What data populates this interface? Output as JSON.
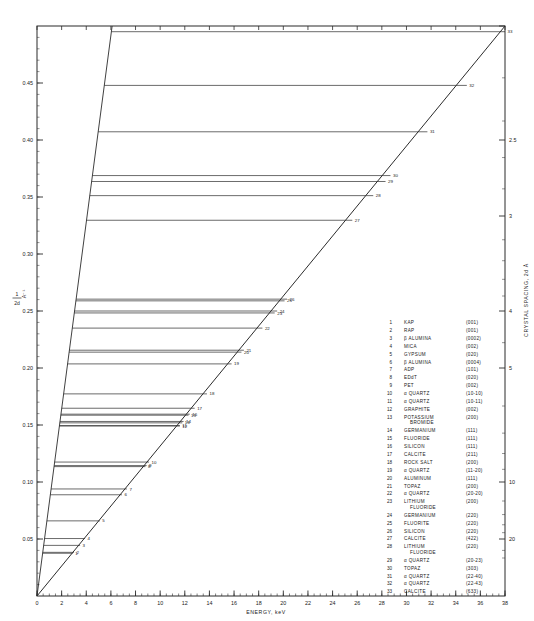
{
  "chart_data": {
    "type": "line",
    "title": "",
    "xlabel": "ENERGY, keV",
    "ylabel": "1/2d, A-1",
    "ylabel_numerator": "1",
    "ylabel_denominator": "2d",
    "ylabel_units": "A⁻¹",
    "right_axis_label": "CRYSTAL SPACING, 2d Å",
    "xlim": [
      0,
      38
    ],
    "ylim": [
      0,
      0.5
    ],
    "xticks": [
      0,
      2,
      4,
      6,
      8,
      10,
      12,
      14,
      16,
      18,
      20,
      22,
      24,
      26,
      28,
      30,
      32,
      34,
      36,
      38
    ],
    "xtick_labels": [
      "0",
      "2",
      "4",
      "6",
      "8",
      "10",
      "12",
      "14",
      "16",
      "18",
      "20",
      "22",
      "24",
      "26",
      "28",
      "30",
      "32",
      "34",
      "36",
      "38"
    ],
    "x_minor_step": 0.5,
    "yticks": [
      0.05,
      0.1,
      0.15,
      0.2,
      0.25,
      0.3,
      0.35,
      0.4,
      0.45
    ],
    "ytick_labels": [
      "0.05",
      "0.10",
      "0.15",
      "0.20",
      "0.25",
      "0.30",
      "0.35",
      "0.40",
      "0.45"
    ],
    "right_ticks_2d": [
      2,
      2.5,
      3,
      4,
      5,
      10,
      20
    ],
    "right_tick_labels": [
      "",
      "2.5",
      "3",
      "4",
      "5",
      "10",
      "20"
    ],
    "grid": false,
    "legend_position": "inside-right",
    "series": [
      {
        "name": "Bragg limit diagonal (1/2d = E/12.398)",
        "type": "line",
        "x": [
          0,
          38
        ],
        "y": [
          0,
          0.5
        ]
      },
      {
        "name": "Left boundary diagonal",
        "type": "line",
        "x": [
          0,
          6.1
        ],
        "y": [
          0,
          0.5
        ]
      }
    ],
    "points": [
      {
        "n": 1,
        "crystal": "KAP",
        "reflection": "(001)",
        "two_d": 26.632,
        "inv2d": 0.0375,
        "energy": 2.9
      },
      {
        "n": 2,
        "crystal": "RAP",
        "reflection": "(001)",
        "two_d": 26.121,
        "inv2d": 0.0383,
        "energy": 3.0
      },
      {
        "n": 3,
        "crystal": "β ALUMINA",
        "reflection": "(0002)",
        "two_d": 22.53,
        "inv2d": 0.0444,
        "energy": 3.5
      },
      {
        "n": 4,
        "crystal": "MICA",
        "reflection": "(002)",
        "two_d": 19.84,
        "inv2d": 0.0504,
        "energy": 3.9
      },
      {
        "n": 5,
        "crystal": "GYPSUM",
        "reflection": "(020)",
        "two_d": 15.185,
        "inv2d": 0.0659,
        "energy": 5.1
      },
      {
        "n": 6,
        "crystal": "β ALUMINA",
        "reflection": "(0004)",
        "two_d": 11.26,
        "inv2d": 0.0888,
        "energy": 6.9
      },
      {
        "n": 7,
        "crystal": "ADP",
        "reflection": "(101)",
        "two_d": 10.648,
        "inv2d": 0.0939,
        "energy": 7.3
      },
      {
        "n": 8,
        "crystal": "EDdT",
        "reflection": "(020)",
        "two_d": 8.808,
        "inv2d": 0.1135,
        "energy": 8.8
      },
      {
        "n": 9,
        "crystal": "PET",
        "reflection": "(002)",
        "two_d": 8.742,
        "inv2d": 0.1144,
        "energy": 8.9
      },
      {
        "n": 10,
        "crystal": "α QUARTZ",
        "reflection": "(10-10)",
        "two_d": 8.512,
        "inv2d": 0.1175,
        "energy": 9.1
      },
      {
        "n": 11,
        "crystal": "α QUARTZ",
        "reflection": "(10-11)",
        "two_d": 6.687,
        "inv2d": 0.1495,
        "energy": 11.6
      },
      {
        "n": 12,
        "crystal": "GRAPHITE",
        "reflection": "(002)",
        "two_d": 6.708,
        "inv2d": 0.1491,
        "energy": 11.6
      },
      {
        "n": 13,
        "crystal": "POTASSIUM BROMIDE",
        "reflection": "(200)",
        "two_d": 6.584,
        "inv2d": 0.1519,
        "energy": 11.8
      },
      {
        "n": 14,
        "crystal": "GERMANIUM",
        "reflection": "(111)",
        "two_d": 6.532,
        "inv2d": 0.1531,
        "energy": 11.9
      },
      {
        "n": 15,
        "crystal": "FLUORIDE",
        "reflection": "(111)",
        "two_d": 6.306,
        "inv2d": 0.1586,
        "energy": 12.3
      },
      {
        "n": 16,
        "crystal": "SILICON",
        "reflection": "(111)",
        "two_d": 6.271,
        "inv2d": 0.1595,
        "energy": 12.4
      },
      {
        "n": 17,
        "crystal": "CALCITE",
        "reflection": "(211)",
        "two_d": 6.071,
        "inv2d": 0.1647,
        "energy": 12.8
      },
      {
        "n": 18,
        "crystal": "ROCK SALT",
        "reflection": "(200)",
        "two_d": 5.641,
        "inv2d": 0.1773,
        "energy": 13.8
      },
      {
        "n": 19,
        "crystal": "α QUARTZ",
        "reflection": "(11-20)",
        "two_d": 4.912,
        "inv2d": 0.2036,
        "energy": 15.8
      },
      {
        "n": 20,
        "crystal": "ALUMINUM",
        "reflection": "(111)",
        "two_d": 4.676,
        "inv2d": 0.2139,
        "energy": 16.6
      },
      {
        "n": 21,
        "crystal": "TOPAZ",
        "reflection": "(200)",
        "two_d": 4.638,
        "inv2d": 0.2156,
        "energy": 16.8
      },
      {
        "n": 22,
        "crystal": "α QUARTZ",
        "reflection": "(20-20)",
        "two_d": 4.256,
        "inv2d": 0.235,
        "energy": 18.3
      },
      {
        "n": 23,
        "crystal": "LITHIUM FLUORIDE",
        "reflection": "(200)",
        "two_d": 4.027,
        "inv2d": 0.2483,
        "energy": 19.3
      },
      {
        "n": 24,
        "crystal": "GERMANIUM",
        "reflection": "(220)",
        "two_d": 4.0,
        "inv2d": 0.25,
        "energy": 19.5
      },
      {
        "n": 25,
        "crystal": "FLUORITE",
        "reflection": "(220)",
        "two_d": 3.862,
        "inv2d": 0.2589,
        "energy": 20.1
      },
      {
        "n": 26,
        "crystal": "SILICON",
        "reflection": "(220)",
        "two_d": 3.84,
        "inv2d": 0.2604,
        "energy": 20.3
      },
      {
        "n": 27,
        "crystal": "CALCITE",
        "reflection": "(422)",
        "two_d": 3.034,
        "inv2d": 0.3296,
        "energy": 25.6
      },
      {
        "n": 28,
        "crystal": "LITHIUM FLUORIDE",
        "reflection": "(220)",
        "two_d": 2.848,
        "inv2d": 0.3512,
        "energy": 27.3
      },
      {
        "n": 29,
        "crystal": "α QUARTZ",
        "reflection": "(20-23)",
        "two_d": 2.75,
        "inv2d": 0.3636,
        "energy": 28.3
      },
      {
        "n": 30,
        "crystal": "TOPAZ",
        "reflection": "(303)",
        "two_d": 2.712,
        "inv2d": 0.3688,
        "energy": 28.7
      },
      {
        "n": 31,
        "crystal": "α QUARTZ",
        "reflection": "(22-40)",
        "two_d": 2.456,
        "inv2d": 0.4072,
        "energy": 31.7
      },
      {
        "n": 32,
        "crystal": "α QUARTZ",
        "reflection": "(22-43)",
        "two_d": 2.233,
        "inv2d": 0.4479,
        "energy": 34.9
      },
      {
        "n": 33,
        "crystal": "CALCITE",
        "reflection": "(633)",
        "two_d": 2.02,
        "inv2d": 0.495,
        "energy": 38.0
      }
    ]
  },
  "legend": {
    "entries": [
      {
        "n": "1",
        "name": "KAP",
        "idx": "(001)"
      },
      {
        "n": "2",
        "name": "RAP",
        "idx": "(001)"
      },
      {
        "n": "3",
        "name": "β ALUMINA",
        "idx": "(0002)"
      },
      {
        "n": "4",
        "name": "MICA",
        "idx": "(002)"
      },
      {
        "n": "5",
        "name": "GYPSUM",
        "idx": "(020)"
      },
      {
        "n": "6",
        "name": "β ALUMINA",
        "idx": "(0004)"
      },
      {
        "n": "7",
        "name": "ADP",
        "idx": "(101)"
      },
      {
        "n": "8",
        "name": "EDdT",
        "idx": "(020)"
      },
      {
        "n": "9",
        "name": "PET",
        "idx": "(002)"
      },
      {
        "n": "10",
        "name": "α QUARTZ",
        "idx": "(10-10)"
      },
      {
        "n": "11",
        "name": "α QUARTZ",
        "idx": "(10-11)"
      },
      {
        "n": "12",
        "name": "GRAPHITE",
        "idx": "(002)"
      },
      {
        "n": "13",
        "name": "POTASSIUM BROMIDE",
        "idx": "(200)",
        "name2": "BROMIDE",
        "name1": "POTASSIUM"
      },
      {
        "n": "14",
        "name": "GERMANIUM",
        "idx": "(111)"
      },
      {
        "n": "15",
        "name": "FLUORIDE",
        "idx": "(111)"
      },
      {
        "n": "16",
        "name": "SILICON",
        "idx": "(111)"
      },
      {
        "n": "17",
        "name": "CALCITE",
        "idx": "(211)"
      },
      {
        "n": "18",
        "name": "ROCK SALT",
        "idx": "(200)"
      },
      {
        "n": "19",
        "name": "α QUARTZ",
        "idx": "(11-20)"
      },
      {
        "n": "20",
        "name": "ALUMINUM",
        "idx": "(111)"
      },
      {
        "n": "21",
        "name": "TOPAZ",
        "idx": "(200)"
      },
      {
        "n": "22",
        "name": "α QUARTZ",
        "idx": "(20-20)"
      },
      {
        "n": "23",
        "name": "LITHIUM FLUORIDE",
        "idx": "(200)",
        "name1": "LITHIUM",
        "name2": "FLUORIDE"
      },
      {
        "n": "24",
        "name": "GERMANIUM",
        "idx": "(220)"
      },
      {
        "n": "25",
        "name": "FLUORITE",
        "idx": "(220)"
      },
      {
        "n": "26",
        "name": "SILICON",
        "idx": "(220)"
      },
      {
        "n": "27",
        "name": "CALCITE",
        "idx": "(422)"
      },
      {
        "n": "28",
        "name": "LITHIUM FLUORIDE",
        "idx": "(220)",
        "name1": "LITHIUM",
        "name2": "FLUORIDE"
      },
      {
        "n": "29",
        "name": "α QUARTZ",
        "idx": "(20-23)"
      },
      {
        "n": "30",
        "name": "TOPAZ",
        "idx": "(303)"
      },
      {
        "n": "31",
        "name": "α QUARTZ",
        "idx": "(22-40)"
      },
      {
        "n": "32",
        "name": "α QUARTZ",
        "idx": "(22-43)"
      },
      {
        "n": "33",
        "name": "CALCITE",
        "idx": "(633)"
      }
    ]
  },
  "style": {
    "line_color": "#2b2b2b",
    "axis_color": "#2b2b2b",
    "background": "#ffffff"
  }
}
